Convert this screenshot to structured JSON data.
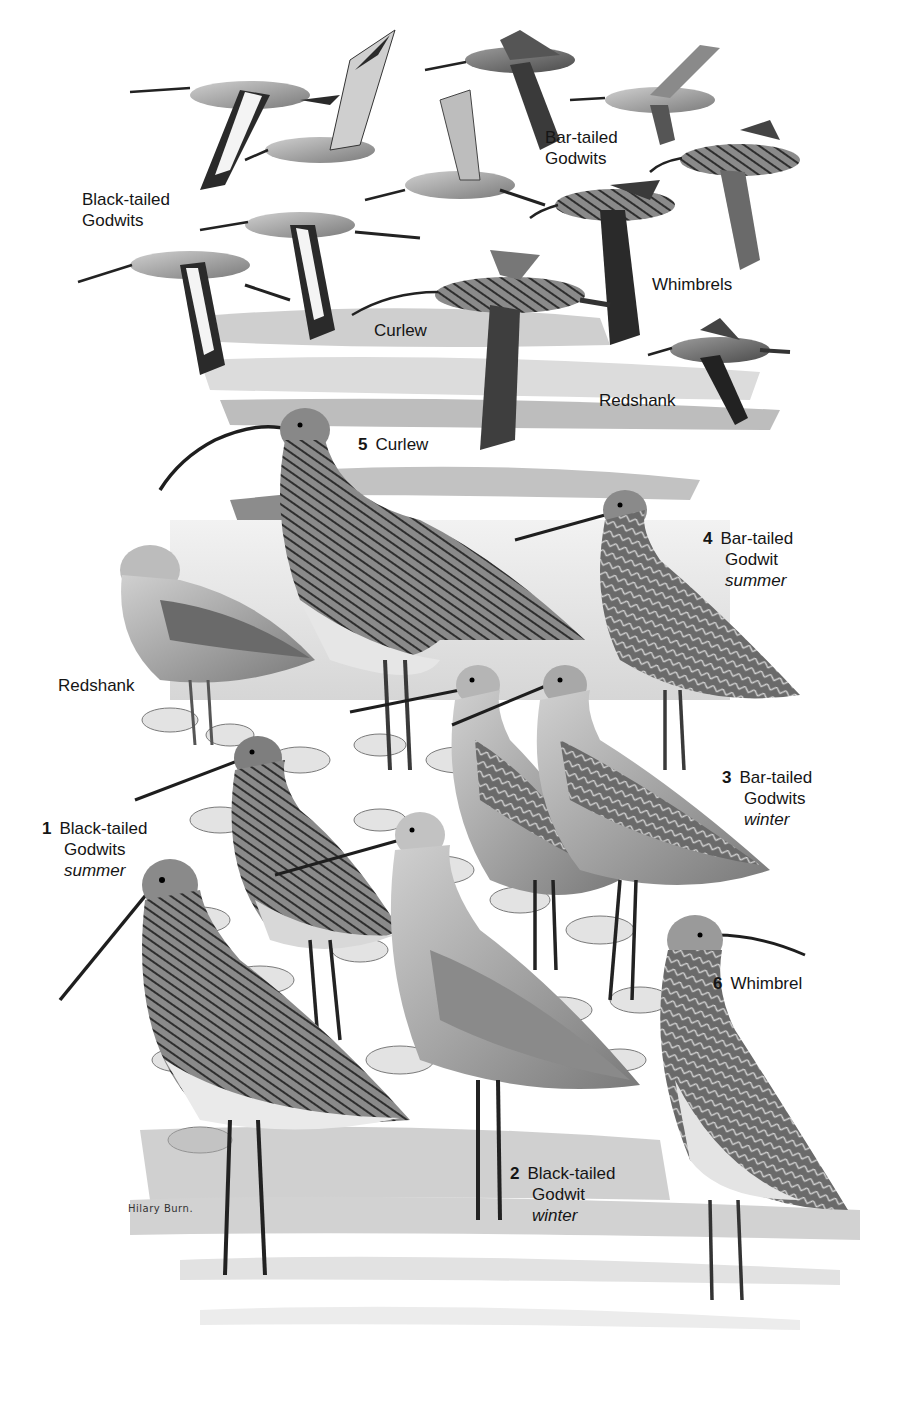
{
  "plate": {
    "artist_signature": "Hilary Burn.",
    "palette": {
      "paper": "#ffffff",
      "water_light": "#e6e6e6",
      "water_mid": "#c8c8c8",
      "mud": "#9a9a9a",
      "bird_dark": "#2b2b2b",
      "bird_mid": "#6e6e6e",
      "bird_light": "#b8b8b8",
      "label_text": "#151515"
    }
  },
  "flight_labels": [
    {
      "id": "black-tailed-godwits-flight",
      "lines": [
        "Black-tailed",
        "Godwits"
      ]
    },
    {
      "id": "bar-tailed-godwits-flight",
      "lines": [
        "Bar-tailed",
        "Godwits"
      ]
    },
    {
      "id": "whimbrels-flight",
      "lines": [
        "Whimbrels"
      ]
    },
    {
      "id": "curlew-flight",
      "lines": [
        "Curlew"
      ]
    },
    {
      "id": "redshank-flight",
      "lines": [
        "Redshank"
      ]
    }
  ],
  "standing_labels": [
    {
      "id": "curlew",
      "number": "5",
      "lines": [
        "Curlew"
      ],
      "season": ""
    },
    {
      "id": "bar-tailed-godwit-summer",
      "number": "4",
      "lines": [
        "Bar-tailed",
        "Godwit"
      ],
      "season": "summer"
    },
    {
      "id": "redshank",
      "number": "",
      "lines": [
        "Redshank"
      ],
      "season": ""
    },
    {
      "id": "bar-tailed-godwits-winter",
      "number": "3",
      "lines": [
        "Bar-tailed",
        "Godwits"
      ],
      "season": "winter"
    },
    {
      "id": "black-tailed-godwits-summer",
      "number": "1",
      "lines": [
        "Black-tailed",
        "Godwits"
      ],
      "season": "summer"
    },
    {
      "id": "whimbrel",
      "number": "6",
      "lines": [
        "Whimbrel"
      ],
      "season": ""
    },
    {
      "id": "black-tailed-godwit-winter",
      "number": "2",
      "lines": [
        "Black-tailed",
        "Godwit"
      ],
      "season": "winter"
    }
  ]
}
